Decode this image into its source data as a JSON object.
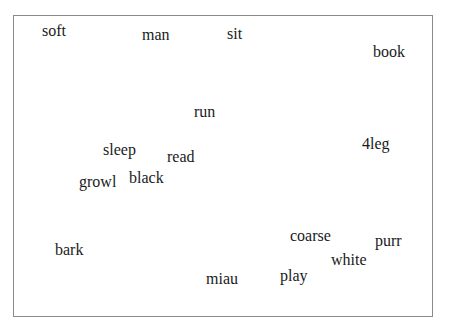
{
  "frame": {
    "left": 13,
    "top": 15,
    "width": 418,
    "height": 300,
    "border_color": "#8a8a8a"
  },
  "words": [
    {
      "text": "soft",
      "x": 42,
      "y": 23
    },
    {
      "text": "man",
      "x": 142,
      "y": 27
    },
    {
      "text": "sit",
      "x": 227,
      "y": 26
    },
    {
      "text": "book",
      "x": 373,
      "y": 44
    },
    {
      "text": "run",
      "x": 194,
      "y": 104
    },
    {
      "text": "sleep",
      "x": 103,
      "y": 142
    },
    {
      "text": "read",
      "x": 167,
      "y": 149
    },
    {
      "text": "4leg",
      "x": 362,
      "y": 136
    },
    {
      "text": "growl",
      "x": 79,
      "y": 174
    },
    {
      "text": "black",
      "x": 129,
      "y": 170
    },
    {
      "text": "bark",
      "x": 55,
      "y": 242
    },
    {
      "text": "coarse",
      "x": 290,
      "y": 228
    },
    {
      "text": "purr",
      "x": 375,
      "y": 233
    },
    {
      "text": "white",
      "x": 331,
      "y": 252
    },
    {
      "text": "play",
      "x": 280,
      "y": 268
    },
    {
      "text": "miau",
      "x": 206,
      "y": 271
    }
  ]
}
